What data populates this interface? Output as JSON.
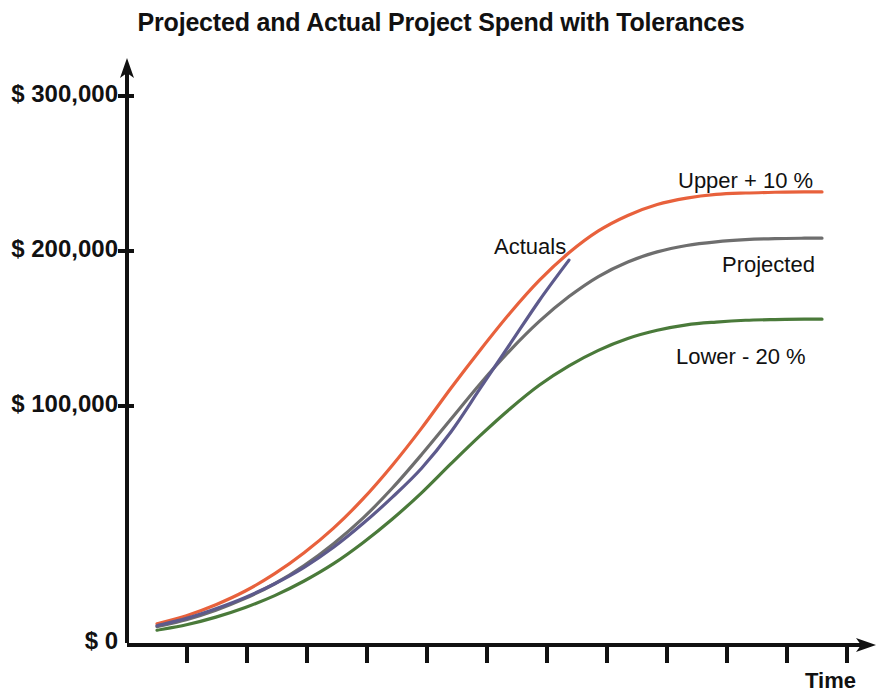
{
  "chart_data": {
    "type": "line",
    "title": "Projected and Actual Project Spend with Tolerances",
    "xlabel": "Time",
    "ylabel": "",
    "ylim": [
      0,
      330000
    ],
    "xlim": [
      0,
      12
    ],
    "grid": false,
    "legend_position": "inline-right-of-curves",
    "ytick_labels": [
      "$ 300,000",
      "$ 200,000",
      "$ 100,000",
      "$ 0"
    ],
    "ytick_values": [
      300000,
      200000,
      100000,
      0
    ],
    "xtick_labels": [],
    "xtick_count": 12,
    "x": [
      0,
      0.5,
      1,
      1.5,
      2,
      2.5,
      3,
      3.5,
      4,
      4.5,
      5,
      5.5,
      6,
      6.5,
      7,
      7.5,
      8,
      8.5,
      9,
      9.5,
      10,
      10.5,
      11,
      11.3
    ],
    "series": [
      {
        "name": "Upper + 10 %",
        "label": "Upper + 10 %",
        "color": "#E8613C",
        "values": [
          10500,
          15000,
          21000,
          28500,
          38000,
          49500,
          63000,
          79000,
          97500,
          118000,
          140000,
          161000,
          181000,
          199000,
          214000,
          226000,
          234500,
          240500,
          244000,
          246000,
          246800,
          247200,
          247400,
          247400
        ]
      },
      {
        "name": "Projected",
        "label": "Projected",
        "color": "#6E6E6E",
        "values": [
          9000,
          12800,
          18000,
          24500,
          32500,
          42500,
          54500,
          68500,
          85000,
          103500,
          123000,
          142500,
          160500,
          176500,
          190000,
          201000,
          209000,
          214500,
          218000,
          220000,
          221200,
          221800,
          222000,
          222000
        ]
      },
      {
        "name": "Actuals",
        "label": "Actuals",
        "color": "#5D5A8C",
        "values": [
          9500,
          13500,
          18800,
          25000,
          32500,
          41500,
          52500,
          65500,
          80000,
          96000,
          116000,
          140000,
          164000,
          188000,
          210000,
          null,
          null,
          null,
          null,
          null,
          null,
          null,
          null,
          null
        ]
      },
      {
        "name": "Lower - 20 %",
        "label": "Lower - 20 %",
        "color": "#4A7A3A",
        "values": [
          7000,
          10000,
          14200,
          19500,
          26000,
          34000,
          43500,
          55000,
          68000,
          82500,
          98500,
          114000,
          128500,
          141500,
          152000,
          160500,
          167000,
          171500,
          174500,
          176000,
          177000,
          177400,
          177600,
          177600
        ]
      }
    ],
    "annotations": [
      {
        "text": "Upper + 10 %",
        "x_px": 678,
        "y_px": 168,
        "series": "Upper + 10 %"
      },
      {
        "text": "Projected",
        "x_px": 722,
        "y_px": 252,
        "series": "Projected"
      },
      {
        "text": "Lower - 20 %",
        "x_px": 676,
        "y_px": 344,
        "series": "Lower - 20 %"
      },
      {
        "text": "Actuals",
        "x_px": 494,
        "y_px": 234,
        "series": "Actuals"
      }
    ]
  },
  "axes": {
    "y_ticks": [
      {
        "label": "$ 300,000",
        "y_px": 96
      },
      {
        "label": "$ 200,000",
        "y_px": 251
      },
      {
        "label": "$ 100,000",
        "y_px": 406
      },
      {
        "label": "$ 0",
        "y_px": 643
      }
    ],
    "x_axis_title": "Time"
  }
}
